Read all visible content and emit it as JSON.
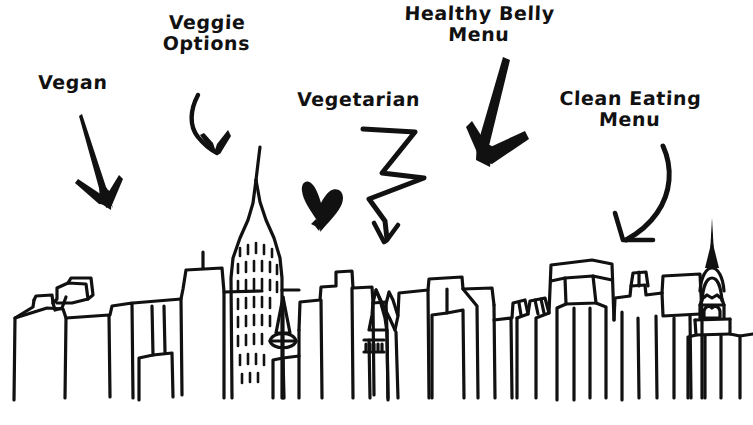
{
  "image": {
    "title": "Hand-drawn city skyline with labelled arrows",
    "background_color": "#ffffff",
    "ink_color": "#111111",
    "width": 753,
    "height": 425
  },
  "annotations": [
    {
      "id": "vegan",
      "label": "Vegan",
      "arrow": "straight-down-right-arrow"
    },
    {
      "id": "veggie-options",
      "label": "Veggie\nOptions",
      "arrow": "curved-hook-down-arrow"
    },
    {
      "id": "vegetarian",
      "label": "Vegetarian",
      "arrow": "zigzag-down-arrow"
    },
    {
      "id": "healthy-belly-menu",
      "label": "Healthy Belly\nMenu",
      "arrow": "bold-down-arrow"
    },
    {
      "id": "clean-eating-menu",
      "label": "Clean Eating\nMenu",
      "arrow": "curved-down-left-arrow"
    }
  ],
  "decorations": [
    {
      "id": "heart",
      "name": "hand-drawn-heart"
    }
  ],
  "skyline": {
    "name": "new-york-city-skyline-sketch",
    "landmarks": [
      "empire-state-building",
      "chrysler-building"
    ]
  }
}
